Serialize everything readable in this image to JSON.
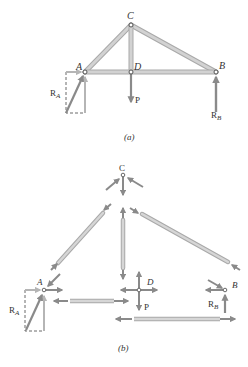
{
  "figure_a": {
    "caption": "(a)",
    "joints": {
      "A": "A",
      "B": "B",
      "C": "C",
      "D": "D"
    },
    "loads": {
      "P": "P",
      "R_A": "R",
      "R_A_sub": "A",
      "R_B": "R",
      "R_B_sub": "B"
    }
  },
  "figure_b": {
    "caption": "(b)",
    "joints": {
      "A": "A",
      "B": "B",
      "C": "C",
      "D": "D"
    },
    "loads": {
      "P": "P",
      "R_A": "R",
      "R_A_sub": "A",
      "R_B": "R",
      "R_B_sub": "B"
    }
  },
  "colors": {
    "member": "#c9c9c9",
    "member_edge": "#a9a9a9",
    "arrow": "#8a8a8a",
    "dashed": "#444444",
    "text": "#333333"
  }
}
